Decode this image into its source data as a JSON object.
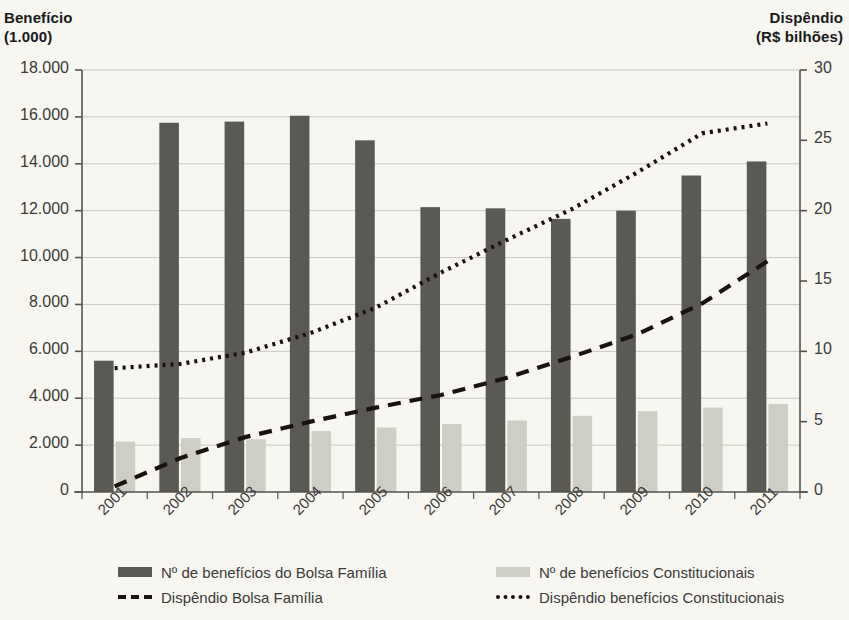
{
  "axis_titles": {
    "left": "Benefício\n(1.000)",
    "right": "Dispêndio\n(R$ bilhões)"
  },
  "legend": {
    "items": [
      {
        "key": "bars_bolsa",
        "marker": "dark-swatch",
        "label": "Nº de benefícios do Bolsa Família"
      },
      {
        "key": "line_bolsa",
        "marker": "dashed-line",
        "label": "Dispêndio Bolsa Família"
      },
      {
        "key": "bars_const",
        "marker": "light-swatch",
        "label": "Nº de benefícios Constitucionais"
      },
      {
        "key": "line_const",
        "marker": "dotted-line",
        "label": "Dispêndio benefícios Constitucionais"
      }
    ]
  },
  "colors": {
    "bar_dark": "#5a5954",
    "bar_light": "#cfcec6",
    "line": "#17140f",
    "grid": "#c9c8c0",
    "axis": "#55544f",
    "background": "#f7f6f1",
    "text": "#3b3b39"
  },
  "chart_data": {
    "type": "bar",
    "title": "",
    "xlabel": "",
    "ylabel": "Benefício (1.000)",
    "y2label": "Dispêndio (R$ bilhões)",
    "grid": true,
    "legend_position": "bottom",
    "categories": [
      "2001",
      "2002",
      "2003",
      "2004",
      "2005",
      "2006",
      "2007",
      "2008",
      "2009",
      "2010",
      "2011"
    ],
    "ylim": [
      0,
      18000
    ],
    "yticks": [
      0,
      2000,
      4000,
      6000,
      8000,
      10000,
      12000,
      14000,
      16000,
      18000
    ],
    "ytick_labels": [
      "0",
      "2.000",
      "4.000",
      "6.000",
      "8.000",
      "10.000",
      "12.000",
      "14.000",
      "16.000",
      "18.000"
    ],
    "y2lim": [
      0,
      30
    ],
    "y2ticks": [
      0,
      5,
      10,
      15,
      20,
      25,
      30
    ],
    "y2tick_labels": [
      "0",
      "5",
      "10",
      "15",
      "20",
      "25",
      "30"
    ],
    "series": [
      {
        "name": "Nº de benefícios do Bolsa Família",
        "type": "bar",
        "axis": "left",
        "color": "#5a5954",
        "values": [
          5600,
          15750,
          15800,
          16050,
          15000,
          12150,
          12100,
          11650,
          12000,
          13500,
          14100
        ]
      },
      {
        "name": "Nº de benefícios Constitucionais",
        "type": "bar",
        "axis": "left",
        "color": "#cfcec6",
        "values": [
          2150,
          2300,
          2250,
          2600,
          2750,
          2900,
          3050,
          3250,
          3450,
          3600,
          3750
        ]
      },
      {
        "name": "Dispêndio Bolsa Família",
        "type": "line",
        "style": "dashed",
        "axis": "right",
        "color": "#17140f",
        "values": [
          0.4,
          2.4,
          3.9,
          5.0,
          6.0,
          6.9,
          8.1,
          9.6,
          11.2,
          13.4,
          16.4
        ]
      },
      {
        "name": "Dispêndio benefícios Constitucionais",
        "type": "line",
        "style": "dotted",
        "axis": "right",
        "color": "#17140f",
        "values": [
          8.8,
          9.1,
          9.9,
          11.3,
          13.1,
          15.6,
          17.9,
          20.1,
          22.7,
          25.5,
          26.2
        ]
      }
    ]
  }
}
